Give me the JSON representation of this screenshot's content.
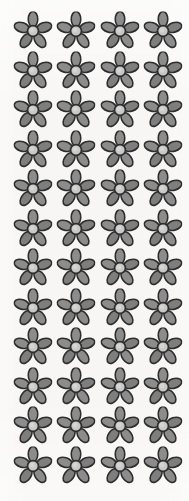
{
  "image": {
    "title": "Gray five-petal flower repeating pattern",
    "subject": "flower",
    "description": "A regular grid of identical five-petal gray flowers on an off-white paper background",
    "width": 189,
    "height": 501
  },
  "background": {
    "color": "#f7f6f4",
    "name": "off-white paper"
  },
  "motif": {
    "name": "five-petal-flower",
    "petal_count": 5,
    "petal_fill": "#8c8c8c",
    "petal_fill_dark": "#7e7e7e",
    "petal_highlight": "#9a9a9a",
    "center_fill": "#c9c9c7",
    "center_highlight": "#d8d8d6",
    "outline_color": "#2e2e2e",
    "outline_width": 1.6,
    "diameter": 33,
    "petal_length": 15.5,
    "petal_width": 9.5,
    "center_radius": 5.4,
    "rotation_deg": 0
  },
  "grid": {
    "columns": 4,
    "rows": 12,
    "count": 48,
    "first_center_x": 33,
    "first_center_y": 31,
    "column_pitch": 43.3,
    "row_pitch": 39.5,
    "column_centers": [
      33,
      76.3,
      119.6,
      162.9
    ],
    "row_centers": [
      31,
      70.5,
      110,
      149.5,
      189,
      228.5,
      268,
      307.5,
      347,
      386.5,
      426,
      465.5
    ]
  }
}
